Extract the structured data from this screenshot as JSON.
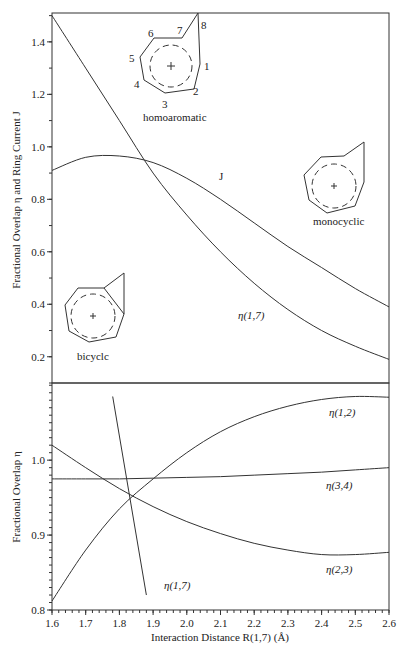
{
  "figure": {
    "xlabel": "Interaction Distance R(1,7) (Å)",
    "top_ylabel": "Fractional Overlap  η  and Ring Current J",
    "bottom_ylabel": "Fractional Overlap  η",
    "annotations": {
      "homoaromatic": "homoaromatic",
      "monocyclic": "monocyclic",
      "bicyclic": "bicyclc",
      "atom_numbers": [
        "1",
        "2",
        "3",
        "4",
        "5",
        "6",
        "7",
        "8"
      ],
      "J": "J",
      "eta17_top": "η(1,7)",
      "eta12": "η(1,2)",
      "eta34": "η(3,4)",
      "eta23": "η(2,3)",
      "eta17_bottom": "η(1,7)"
    }
  },
  "chart_data": [
    {
      "type": "line",
      "panel": "top",
      "title": "",
      "xlabel": "Interaction Distance R(1,7) (Å)",
      "ylabel": "Fractional Overlap η and Ring Current J",
      "xlim": [
        1.6,
        2.6
      ],
      "ylim": [
        0.1,
        1.51
      ],
      "x_ticks": [
        1.6,
        1.7,
        1.8,
        1.9,
        2.0,
        2.1,
        2.2,
        2.3,
        2.4,
        2.5,
        2.6
      ],
      "y_ticks": [
        "0.2",
        "0.4",
        "0.6",
        "0.8",
        "1.0",
        "1.2",
        "1.4"
      ],
      "grid": false,
      "x": [
        1.6,
        1.7,
        1.8,
        1.9,
        2.0,
        2.1,
        2.2,
        2.3,
        2.4,
        2.5,
        2.6
      ],
      "series": [
        {
          "name": "J",
          "values": [
            0.91,
            0.96,
            0.965,
            0.94,
            0.88,
            0.8,
            0.71,
            0.62,
            0.54,
            0.46,
            0.39
          ]
        },
        {
          "name": "η(1,7)",
          "values": [
            1.5,
            1.3,
            1.1,
            0.9,
            0.74,
            0.6,
            0.48,
            0.38,
            0.3,
            0.24,
            0.19
          ]
        }
      ]
    },
    {
      "type": "line",
      "panel": "bottom",
      "title": "",
      "xlabel": "Interaction Distance R(1,7) (Å)",
      "ylabel": "Fractional Overlap η",
      "xlim": [
        1.6,
        2.6
      ],
      "ylim": [
        0.8,
        1.103
      ],
      "x_ticks": [
        "1.6",
        "1.7",
        "1.8",
        "1.9",
        "2.0",
        "2.1",
        "2.2",
        "2.3",
        "2.4",
        "2.5",
        "2.6"
      ],
      "y_ticks": [
        "0.8",
        "0.9",
        "1.0"
      ],
      "grid": false,
      "x": [
        1.6,
        1.7,
        1.8,
        1.9,
        2.0,
        2.1,
        2.2,
        2.3,
        2.4,
        2.5,
        2.6
      ],
      "series": [
        {
          "name": "η(1,2)",
          "values": [
            0.812,
            0.88,
            0.935,
            0.975,
            1.01,
            1.038,
            1.058,
            1.072,
            1.081,
            1.085,
            1.084
          ]
        },
        {
          "name": "η(3,4)",
          "values": [
            0.975,
            0.975,
            0.975,
            0.976,
            0.977,
            0.978,
            0.98,
            0.982,
            0.984,
            0.987,
            0.99
          ]
        },
        {
          "name": "η(2,3)",
          "values": [
            1.02,
            0.99,
            0.962,
            0.938,
            0.918,
            0.902,
            0.889,
            0.88,
            0.874,
            0.874,
            0.877
          ]
        },
        {
          "name": "η(1,7)",
          "x": [
            1.78,
            1.88
          ],
          "values": [
            1.085,
            0.82
          ]
        }
      ]
    }
  ]
}
